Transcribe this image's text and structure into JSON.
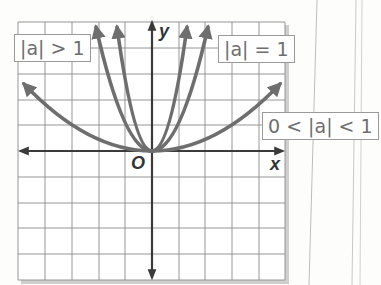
{
  "diagram": {
    "title": "",
    "axes": {
      "x_label": "x",
      "y_label": "y",
      "origin_label": "O"
    },
    "labels": {
      "greater": "|a| > 1",
      "equal": "|a| = 1",
      "less": "0 < |a| < 1"
    },
    "colors": {
      "curves": "#6e6e6e",
      "axes": "#3a3a3a",
      "grid": "#8a8a8a",
      "label_border": "#9a9a9a"
    },
    "curves": [
      {
        "name": "|a| > 1 (steep)",
        "a": 4
      },
      {
        "name": "|a| > 1",
        "a": 2
      },
      {
        "name": "|a| = 1",
        "a": 1
      },
      {
        "name": "0 < |a| < 1",
        "a": 0.25
      }
    ]
  }
}
